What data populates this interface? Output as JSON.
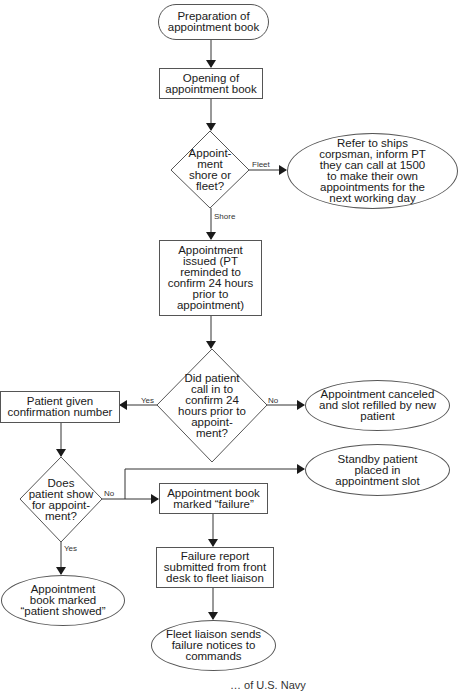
{
  "flowchart": {
    "nodes": {
      "start": "Preparation of appointment book",
      "open": "Opening of appointment book",
      "decision_shore_fleet": "Appoint-\nment\nshore or\nfleet?",
      "refer_corpsman": "Refer to ships corpsman, inform PT they can call at 1500 to make their own appointments for the next working day",
      "issued": "Appointment issued (PT reminded to confirm 24 hours prior to appointment)",
      "decision_confirm": "Did patient\ncall in to\nconfirm 24\nhours prior to\nappoint-\nment?",
      "given_number": "Patient given confirmation number",
      "canceled": "Appointment canceled and slot refilled by new patient",
      "decision_show": "Does\npatient show\nfor appoint-\nment?",
      "standby": "Standby patient placed in appointment slot",
      "marked_failure": "Appointment book marked “failure”",
      "failure_report": "Failure report submitted from front desk to fleet liaison",
      "patient_showed": "Appointment book marked “patient showed”",
      "fleet_notices": "Fleet liaison sends failure notices to commands"
    },
    "edge_labels": {
      "fleet": "Fleet",
      "shore": "Shore",
      "confirm_yes": "Yes",
      "confirm_no": "No",
      "show_no": "No",
      "show_yes": "Yes"
    },
    "footer_fragment": "… of U.S. Navy"
  }
}
